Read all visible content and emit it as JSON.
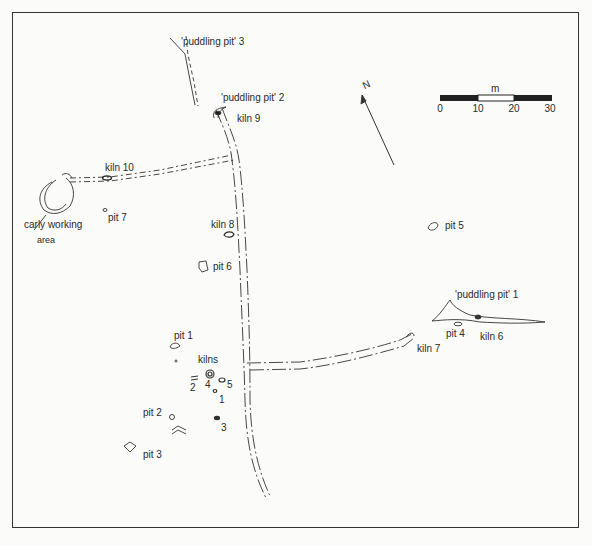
{
  "labels": {
    "puddling_pit_3": "'puddling pit' 3",
    "puddling_pit_2": "'puddling pit' 2",
    "puddling_pit_1": "'puddling pit' 1",
    "kiln_9": "kiln 9",
    "kiln_10": "kiln 10",
    "kiln_8": "kiln 8",
    "kiln_7": "kiln 7",
    "kiln_6": "kiln 6",
    "kilns": "kilns",
    "kiln_num_1": "1",
    "kiln_num_2": "2",
    "kiln_num_3": "3",
    "kiln_num_4": "4",
    "kiln_num_5": "5",
    "early_working": "carly working",
    "area": "area",
    "pit_1": "pit 1",
    "pit_2": "pit 2",
    "pit_3": "pit 3",
    "pit_4": "pit 4",
    "pit_5": "pit 5",
    "pit_6": "pit 6",
    "pit_7": "pit 7"
  },
  "north_arrow": {
    "label": "N"
  },
  "scale_bar": {
    "unit": "m",
    "ticks": [
      "0",
      "10",
      "20",
      "30"
    ]
  }
}
